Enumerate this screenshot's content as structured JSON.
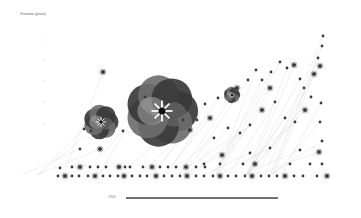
{
  "chart_data": {
    "type": "scatter",
    "title": "",
    "ylabel": "Duration (years)",
    "xlabel": "",
    "timeline_label": "1950",
    "grid": false,
    "legend": null,
    "style": "grayscale flower glyphs with faint diagonal connector lines",
    "colors": {
      "dark": "#3a3a3a",
      "mid": "#6e6e6e",
      "light": "#a8a8a8",
      "line": "#d4d4d4",
      "accent": "#111111"
    },
    "large_glyphs": [
      {
        "x": 101,
        "y": 122,
        "r": 17
      },
      {
        "x": 162,
        "y": 111,
        "r": 35
      },
      {
        "x": 232,
        "y": 95,
        "r": 8
      }
    ],
    "points": [
      [
        103,
        72
      ],
      [
        84,
        129
      ],
      [
        91,
        131
      ],
      [
        80,
        149
      ],
      [
        100,
        149
      ],
      [
        123,
        131
      ],
      [
        145,
        97
      ],
      [
        218,
        98
      ],
      [
        237,
        88
      ],
      [
        248,
        80
      ],
      [
        256,
        70
      ],
      [
        262,
        80
      ],
      [
        270,
        88
      ],
      [
        271,
        72
      ],
      [
        280,
        62
      ],
      [
        287,
        68
      ],
      [
        294,
        65
      ],
      [
        300,
        79
      ],
      [
        304,
        88
      ],
      [
        311,
        97
      ],
      [
        314,
        74
      ],
      [
        318,
        58
      ],
      [
        322,
        46
      ],
      [
        323,
        36
      ],
      [
        320,
        66
      ],
      [
        321,
        103
      ],
      [
        320,
        122
      ],
      [
        322,
        141
      ],
      [
        305,
        110
      ],
      [
        295,
        122
      ],
      [
        285,
        118
      ],
      [
        275,
        102
      ],
      [
        262,
        110
      ],
      [
        250,
        125
      ],
      [
        240,
        133
      ],
      [
        228,
        128
      ],
      [
        210,
        118
      ],
      [
        205,
        104
      ],
      [
        197,
        120
      ],
      [
        183,
        120
      ],
      [
        190,
        130
      ],
      [
        214,
        138
      ],
      [
        60,
        168
      ],
      [
        72,
        167
      ],
      [
        80,
        167
      ],
      [
        90,
        167
      ],
      [
        98,
        167
      ],
      [
        106,
        167
      ],
      [
        119,
        167
      ],
      [
        125,
        167
      ],
      [
        130,
        167
      ],
      [
        143,
        167
      ],
      [
        152,
        167
      ],
      [
        160,
        167
      ],
      [
        168,
        167
      ],
      [
        176,
        167
      ],
      [
        186,
        167
      ],
      [
        196,
        167
      ],
      [
        205,
        167
      ],
      [
        58,
        176
      ],
      [
        65,
        176
      ],
      [
        72,
        176
      ],
      [
        79,
        176
      ],
      [
        88,
        176
      ],
      [
        95,
        176
      ],
      [
        103,
        176
      ],
      [
        110,
        176
      ],
      [
        118,
        176
      ],
      [
        124,
        176
      ],
      [
        132,
        176
      ],
      [
        140,
        176
      ],
      [
        147,
        176
      ],
      [
        156,
        176
      ],
      [
        164,
        176
      ],
      [
        172,
        176
      ],
      [
        180,
        176
      ],
      [
        187,
        176
      ],
      [
        196,
        176
      ],
      [
        204,
        176
      ],
      [
        213,
        176
      ],
      [
        220,
        176
      ],
      [
        228,
        176
      ],
      [
        236,
        176
      ],
      [
        245,
        176
      ],
      [
        252,
        176
      ],
      [
        261,
        176
      ],
      [
        269,
        176
      ],
      [
        277,
        176
      ],
      [
        285,
        176
      ],
      [
        294,
        176
      ],
      [
        303,
        176
      ],
      [
        317,
        176
      ],
      [
        327,
        176
      ],
      [
        204,
        164
      ],
      [
        220,
        164
      ],
      [
        243,
        164
      ],
      [
        255,
        164
      ],
      [
        290,
        164
      ],
      [
        310,
        164
      ],
      [
        322,
        164
      ],
      [
        222,
        155
      ],
      [
        250,
        153
      ],
      [
        270,
        148
      ],
      [
        300,
        150
      ],
      [
        319,
        152
      ]
    ],
    "timeline": {
      "x1": 126,
      "x2": 278,
      "y": 198
    }
  }
}
